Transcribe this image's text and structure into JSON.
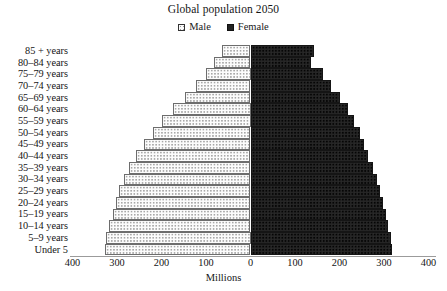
{
  "chart_data": {
    "type": "bar",
    "subtype": "population-pyramid",
    "title": "Global population 2050",
    "xlabel": "Millions",
    "ylabel": "",
    "orientation": "horizontal",
    "grid": false,
    "legend_position": "top-center",
    "xlim": [
      -400,
      400
    ],
    "xticks": [
      400,
      300,
      200,
      100,
      0,
      100,
      200,
      300,
      400
    ],
    "xtick_labels": [
      "400",
      "300",
      "200",
      "100",
      "0",
      "100",
      "200",
      "300",
      "400"
    ],
    "units": "Millions",
    "categories": [
      "85 + years",
      "80–84 years",
      "75–79 years",
      "70–74 years",
      "65–69 years",
      "60–64 years",
      "55–59 years",
      "50–54 years",
      "45–49 years",
      "40–44 years",
      "35–39 years",
      "30–34 years",
      "25–29 years",
      "20–24 years",
      "15–19 years",
      "10–14 years",
      "5–9 years",
      "Under 5"
    ],
    "series": [
      {
        "name": "Male",
        "side": "left",
        "color": "#fcfcfc",
        "pattern": "dotted",
        "values": [
          65,
          82,
          100,
          122,
          148,
          175,
          200,
          220,
          240,
          258,
          272,
          285,
          295,
          302,
          310,
          318,
          325,
          328
        ]
      },
      {
        "name": "Female",
        "side": "right",
        "color": "#242424",
        "pattern": "solid-dark",
        "values": [
          142,
          135,
          163,
          182,
          200,
          218,
          232,
          245,
          255,
          265,
          275,
          285,
          292,
          298,
          305,
          310,
          315,
          318
        ]
      }
    ]
  },
  "legend": {
    "entries": [
      {
        "label": "Male",
        "swatch": "male-swatch-icon"
      },
      {
        "label": "Female",
        "swatch": "female-swatch-icon"
      }
    ]
  }
}
